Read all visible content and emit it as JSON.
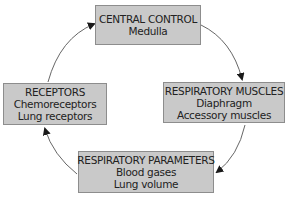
{
  "diagram": {
    "type": "cycle",
    "nodes": [
      {
        "id": "central",
        "title": "CENTRAL CONTROL",
        "lines": [
          "Medulla"
        ]
      },
      {
        "id": "muscles",
        "title": "RESPIRATORY MUSCLES",
        "lines": [
          "Diaphragm",
          "Accessory muscles"
        ]
      },
      {
        "id": "params",
        "title": "RESPIRATORY PARAMETERS",
        "lines": [
          "Blood gases",
          "Lung volume"
        ]
      },
      {
        "id": "receptors",
        "title": "RECEPTORS",
        "lines": [
          "Chemoreceptors",
          "Lung receptors"
        ]
      }
    ],
    "edges": [
      {
        "from": "central",
        "to": "muscles"
      },
      {
        "from": "muscles",
        "to": "params"
      },
      {
        "from": "params",
        "to": "receptors"
      },
      {
        "from": "receptors",
        "to": "central"
      }
    ],
    "colors": {
      "box_fill": "#c9c9c9",
      "box_border": "#8d8d8d",
      "text": "#222222",
      "arrow": "#555555"
    }
  }
}
